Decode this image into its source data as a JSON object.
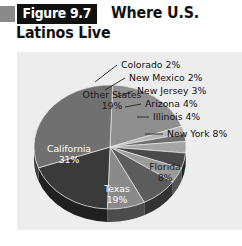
{
  "figure": {
    "badge_label": "Figure 9.7",
    "title_line1": "Where U.S.",
    "title_line2": "Latinos Live"
  },
  "chart_data": {
    "type": "pie",
    "title": "Where U.S. Latinos Live",
    "figure_number": "Figure 9.7",
    "unit": "percent",
    "legend": "none",
    "labels_position": "inside-and-callout",
    "categories": [
      "Other States",
      "Colorado",
      "New Mexico",
      "New Jersey",
      "Arizona",
      "Illinois",
      "New York",
      "Florida",
      "Texas",
      "California"
    ],
    "values": [
      19,
      2,
      2,
      3,
      4,
      4,
      8,
      8,
      19,
      31
    ],
    "slices": [
      {
        "name": "Other States",
        "value": 19,
        "label": "Other States",
        "value_label": "19%",
        "placement": "inside",
        "fill": "#8f8f8f"
      },
      {
        "name": "Colorado",
        "value": 2,
        "label": "Colorado 2%",
        "value_label": "2%",
        "placement": "callout",
        "fill": "#b5b5b5"
      },
      {
        "name": "New Mexico",
        "value": 2,
        "label": "New Mexico 2%",
        "value_label": "2%",
        "placement": "callout",
        "fill": "#6e6e6e"
      },
      {
        "name": "New Jersey",
        "value": 3,
        "label": "New Jersey 3%",
        "value_label": "3%",
        "placement": "callout",
        "fill": "#a5a5a5"
      },
      {
        "name": "Arizona",
        "value": 4,
        "label": "Arizona 4%",
        "value_label": "4%",
        "placement": "callout",
        "fill": "#4a4a4a"
      },
      {
        "name": "Illinois",
        "value": 4,
        "label": "Illinois 4%",
        "value_label": "4%",
        "placement": "callout",
        "fill": "#9a9a9a"
      },
      {
        "name": "New York",
        "value": 8,
        "label": "New York 8%",
        "value_label": "8%",
        "placement": "callout",
        "fill": "#5c5c5c"
      },
      {
        "name": "Florida",
        "value": 8,
        "label": "Florida",
        "value_label": "8%",
        "placement": "inside",
        "fill": "#8a8a8a"
      },
      {
        "name": "Texas",
        "value": 19,
        "label": "Texas",
        "value_label": "19%",
        "placement": "inside",
        "fill": "#3a3a3a"
      },
      {
        "name": "California",
        "value": 31,
        "label": "California",
        "value_label": "31%",
        "placement": "inside",
        "fill": "#707070"
      }
    ],
    "colors": {
      "panel_background": "#ededed",
      "page_background": "#ffffff",
      "badge_background": "#111111",
      "badge_text": "#ffffff",
      "title_text": "#111111",
      "corner_square": "#8a8a8a"
    }
  }
}
